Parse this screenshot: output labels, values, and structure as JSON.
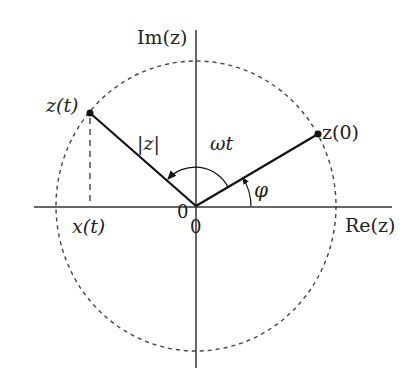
{
  "diagram": {
    "type": "complex-plane phasor diagram",
    "axes": {
      "real_label": "Re(z)",
      "imag_label": "Im(z)",
      "origin_label_x": "0",
      "origin_label_y": "0"
    },
    "circle": {
      "style": "dashed",
      "meaning": "|z| radius circle"
    },
    "points": {
      "z_t": "z(t)",
      "z_0": "z(0)"
    },
    "labels": {
      "magnitude": "|z|",
      "rotation_angle": "ωt",
      "phase_angle": "φ",
      "projection": "x(t)"
    },
    "colors": {
      "stroke": "#222222",
      "dashed": "#444444",
      "background": "#ffffff"
    }
  }
}
